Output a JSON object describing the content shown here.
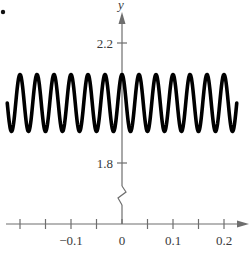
{
  "chart_data": {
    "type": "line",
    "title": "",
    "xlabel": "",
    "ylabel": "y",
    "function": "y = 2 + 0.1 cos(60πx)",
    "xlim": [
      -0.225,
      0.225
    ],
    "ylim": [
      1.8,
      2.2
    ],
    "y_axis_break": true,
    "grid": false,
    "legend": null,
    "x_ticks": [
      -0.2,
      -0.15,
      -0.1,
      -0.05,
      0,
      0.05,
      0.1,
      0.15,
      0.2
    ],
    "x_tick_labels": [
      {
        "value": -0.1,
        "label": "−0.1"
      },
      {
        "value": 0,
        "label": "0"
      },
      {
        "value": 0.1,
        "label": "0.1"
      },
      {
        "value": 0.2,
        "label": "0.2"
      }
    ],
    "y_ticks": [
      {
        "value": 2.2,
        "label": "2.2"
      },
      {
        "value": 1.8,
        "label": "1.8"
      }
    ],
    "series": [
      {
        "name": "y = 2 + 0.1cos(60πx)",
        "amplitude": 0.1,
        "midline": 2.0,
        "period": 0.0333,
        "phase": "peak at x = 0",
        "x": [
          -0.225,
          -0.2,
          -0.1833,
          -0.1667,
          -0.15,
          -0.1333,
          -0.1167,
          -0.1,
          -0.0833,
          -0.0667,
          -0.05,
          -0.0333,
          -0.0167,
          0,
          0.0167,
          0.0333,
          0.05,
          0.0667,
          0.0833,
          0.1,
          0.1167,
          0.1333,
          0.15,
          0.1667,
          0.1833,
          0.2,
          0.225
        ],
        "values": [
          2.0,
          2.1,
          1.9,
          2.1,
          1.9,
          2.1,
          1.9,
          2.1,
          1.9,
          2.1,
          1.9,
          2.1,
          1.9,
          2.1,
          1.9,
          2.1,
          1.9,
          2.1,
          1.9,
          2.1,
          1.9,
          2.1,
          1.9,
          2.1,
          1.9,
          2.1,
          2.0
        ]
      }
    ]
  },
  "labels": {
    "y_axis": "y",
    "marker_dot": "•"
  }
}
